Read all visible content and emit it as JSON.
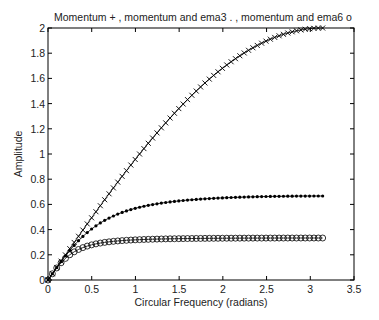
{
  "chart_data": {
    "type": "line",
    "title": "Momentum + , momentum and ema3  . , momentum and ema6  o",
    "xlabel": "Circular Frequency  (radians)",
    "ylabel": "Amplitude",
    "xlim": [
      0,
      3.5
    ],
    "ylim": [
      0,
      2
    ],
    "xticks": [
      0,
      0.5,
      1,
      1.5,
      2,
      2.5,
      3,
      3.5
    ],
    "xtick_labels": [
      "0",
      "0.5",
      "1",
      "1.5",
      "2",
      "2.5",
      "3",
      "3.5"
    ],
    "yticks": [
      0,
      0.2,
      0.4,
      0.6,
      0.8,
      1,
      1.2,
      1.4,
      1.6,
      1.8,
      2
    ],
    "ytick_labels": [
      "0",
      "0.2",
      "0.4",
      "0.6",
      "0.8",
      "1",
      "1.2",
      "1.4",
      "1.6",
      "1.8",
      "2"
    ],
    "grid": false,
    "legend": "in title",
    "x": [
      0,
      0.5,
      1.0,
      1.5,
      2.0,
      2.5,
      3.0,
      3.1416
    ],
    "series": [
      {
        "name": "momentum",
        "marker": "+",
        "values": [
          0,
          0.495,
          0.959,
          1.363,
          1.683,
          1.898,
          1.995,
          2.0
        ],
        "formula": "2*sin(w/2)",
        "alpha": 1
      },
      {
        "name": "momentum and ema3",
        "marker": ".",
        "values": [
          0,
          0.39,
          0.56,
          0.62,
          0.65,
          0.66,
          0.667,
          0.667
        ],
        "formula": "2*sin(w/2)*|a/(1-(1-a)e^{-iw})|",
        "alpha": 0.5
      },
      {
        "name": "momentum and ema6",
        "marker": "o",
        "values": [
          0,
          0.27,
          0.32,
          0.33,
          0.333,
          0.333,
          0.333,
          0.333
        ],
        "formula": "2*sin(w/2)*|a/(1-(1-a)e^{-iw})|",
        "alpha": 0.2857
      }
    ],
    "n_points": 64
  },
  "colors": {
    "line": "#000000",
    "axis": "#000000",
    "text": "#222222",
    "background": "#ffffff"
  }
}
